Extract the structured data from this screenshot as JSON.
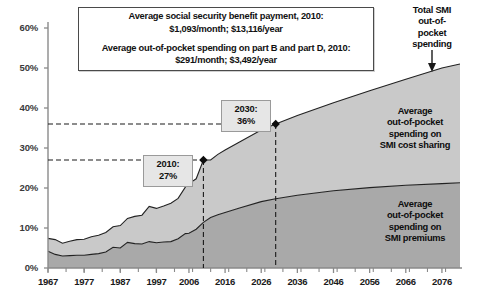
{
  "chart_data": {
    "type": "area",
    "title": "",
    "xlabel": "",
    "ylabel": "",
    "stacked": true,
    "grid": false,
    "legend_position": "in-plot",
    "xlim": [
      1967,
      2081
    ],
    "ylim": [
      0,
      60
    ],
    "ytick_labels": [
      "0%",
      "10%",
      "20%",
      "30%",
      "40%",
      "50%",
      "60%"
    ],
    "ytick_values": [
      0,
      10,
      20,
      30,
      40,
      50,
      60
    ],
    "xtick_labels": [
      "1967",
      "1977",
      "1987",
      "1997",
      "2006",
      "2016",
      "2026",
      "2036",
      "2046",
      "2056",
      "2066",
      "2076"
    ],
    "xtick_values": [
      1967,
      1977,
      1987,
      1997,
      2006,
      2016,
      2026,
      2036,
      2046,
      2056,
      2066,
      2076
    ],
    "series": [
      {
        "name": "Average out-of-pocket spending on SMI premiums",
        "color": "#a9a9a9",
        "x": [
          1967,
          1969,
          1971,
          1973,
          1975,
          1977,
          1979,
          1981,
          1983,
          1985,
          1987,
          1989,
          1991,
          1993,
          1995,
          1997,
          1999,
          2001,
          2003,
          2005,
          2006,
          2008,
          2010,
          2012,
          2014,
          2016,
          2020,
          2026,
          2030,
          2036,
          2046,
          2056,
          2066,
          2076,
          2081
        ],
        "values": [
          4.2,
          3.4,
          3.0,
          3.1,
          3.2,
          3.2,
          3.4,
          3.6,
          4.0,
          5.2,
          5.0,
          6.4,
          6.1,
          6.0,
          6.6,
          6.3,
          6.5,
          6.6,
          7.3,
          8.6,
          8.7,
          9.7,
          11.4,
          12.6,
          13.3,
          13.9,
          15.0,
          16.6,
          17.3,
          18.2,
          19.3,
          20.1,
          20.7,
          21.1,
          21.3
        ]
      },
      {
        "name": "Average out-of-pocket spending on SMI cost sharing",
        "color": "#c9c9c9",
        "x": [
          1967,
          1969,
          1971,
          1973,
          1975,
          1977,
          1979,
          1981,
          1983,
          1985,
          1987,
          1989,
          1991,
          1993,
          1995,
          1997,
          1999,
          2001,
          2003,
          2005,
          2006,
          2008,
          2010,
          2012,
          2014,
          2016,
          2020,
          2026,
          2030,
          2036,
          2046,
          2056,
          2066,
          2076,
          2081
        ],
        "values": [
          3.2,
          3.7,
          3.2,
          3.6,
          3.9,
          4.0,
          4.4,
          4.6,
          4.9,
          5.1,
          5.6,
          6.0,
          6.8,
          7.2,
          8.8,
          8.6,
          9.0,
          9.6,
          10.1,
          11.6,
          12.4,
          12.6,
          15.6,
          14.4,
          15.1,
          15.6,
          16.5,
          17.9,
          18.7,
          19.9,
          22.0,
          24.2,
          26.5,
          28.9,
          29.7
        ]
      }
    ],
    "total_series": {
      "name": "Total SMI out-of-pocket spending",
      "x": [
        1967,
        1969,
        1971,
        1973,
        1975,
        1977,
        1979,
        1981,
        1983,
        1985,
        1987,
        1989,
        1991,
        1993,
        1995,
        1997,
        1999,
        2001,
        2003,
        2005,
        2006,
        2008,
        2010,
        2012,
        2014,
        2016,
        2020,
        2026,
        2030,
        2036,
        2046,
        2056,
        2066,
        2076,
        2081
      ],
      "values": [
        7.4,
        7.1,
        6.2,
        6.7,
        7.1,
        7.2,
        7.8,
        8.2,
        8.9,
        10.3,
        10.6,
        12.4,
        12.9,
        13.2,
        15.4,
        14.9,
        15.5,
        16.2,
        17.4,
        20.2,
        21.1,
        22.3,
        27.0,
        27.0,
        28.4,
        29.5,
        31.5,
        34.5,
        36.0,
        38.1,
        41.3,
        44.3,
        47.2,
        50.0,
        51.0
      ]
    },
    "annotations": [
      {
        "name": "2010-marker",
        "x": 2010,
        "y": 27,
        "label_line1": "2010:",
        "label_line2": "27%"
      },
      {
        "name": "2030-marker",
        "x": 2030,
        "y": 36,
        "label_line1": "2030:",
        "label_line2": "36%"
      }
    ]
  },
  "note_box": {
    "line1": "Average social security benefit payment, 2010:",
    "line2": "$1,093/month; $13,116/year",
    "line3": "Average out-of-pocket spending on part B and part D, 2010:",
    "line4": "$291/month; $3,492/year"
  },
  "labels": {
    "total_callout": "Total SMI\nout-of-\npocket\nspending",
    "total_callout_l1": "Total SMI",
    "total_callout_l2": "out-of-",
    "total_callout_l3": "pocket",
    "total_callout_l4": "spending",
    "cost_sharing_l1": "Average",
    "cost_sharing_l2": "out-of-pocket",
    "cost_sharing_l3": "spending on",
    "cost_sharing_l4": "SMI cost sharing",
    "premiums_l1": "Average",
    "premiums_l2": "out-of-pocket",
    "premiums_l3": "spending on",
    "premiums_l4": "SMI premiums",
    "callout_2010_l1": "2010:",
    "callout_2010_l2": "27%",
    "callout_2030_l1": "2030:",
    "callout_2030_l2": "36%"
  },
  "colors": {
    "band_upper": "#c9c9c9",
    "band_lower": "#a9a9a9",
    "line": "#222222",
    "axis": "#8a8a8a",
    "callout_bg": "#e6e6e6"
  }
}
